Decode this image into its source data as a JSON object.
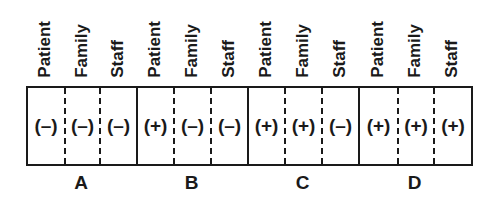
{
  "diagram": {
    "column_headers": [
      "Patient",
      "Family",
      "Staff"
    ],
    "groups": [
      {
        "label": "A",
        "cells": [
          "(–)",
          "(–)",
          "(–)"
        ]
      },
      {
        "label": "B",
        "cells": [
          "(+)",
          "(–)",
          "(–)"
        ]
      },
      {
        "label": "C",
        "cells": [
          "(+)",
          "(+)",
          "(–)"
        ]
      },
      {
        "label": "D",
        "cells": [
          "(+)",
          "(+)",
          "(+)"
        ]
      }
    ],
    "colors": {
      "ink": "#1a1a1a",
      "background": "#ffffff"
    }
  }
}
